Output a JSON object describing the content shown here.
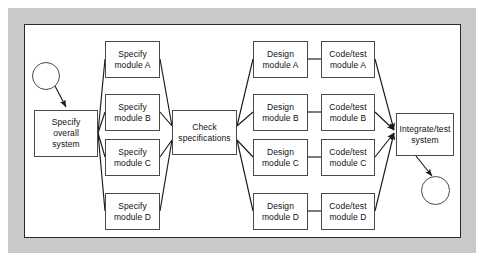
{
  "figure": {
    "background_color": "#ffffff",
    "frame_color": "#c9c9c9",
    "node_fill": "#ffffff",
    "node_border_color": "#4a4a4a",
    "line_color": "#1a1a1a"
  },
  "nodes": {
    "start": {
      "shape": "circle",
      "label": ""
    },
    "end": {
      "shape": "circle",
      "label": ""
    },
    "specify_overall": {
      "line1": "Specify",
      "line2": "overall",
      "line3": "system"
    },
    "check_specs": {
      "line1": "Check",
      "line2": "specifications"
    },
    "integrate": {
      "line1": "Integrate/test",
      "line2": "system"
    },
    "specify_modules": [
      {
        "line1": "Specify",
        "line2": "module A"
      },
      {
        "line1": "Specify",
        "line2": "module B"
      },
      {
        "line1": "Specify",
        "line2": "module C"
      },
      {
        "line1": "Specify",
        "line2": "module D"
      }
    ],
    "design_modules": [
      {
        "line1": "Design",
        "line2": "module A"
      },
      {
        "line1": "Design",
        "line2": "module B"
      },
      {
        "line1": "Design",
        "line2": "module C"
      },
      {
        "line1": "Design",
        "line2": "module D"
      }
    ],
    "code_test_modules": [
      {
        "line1": "Code/test",
        "line2": "module A"
      },
      {
        "line1": "Code/test",
        "line2": "module B"
      },
      {
        "line1": "Code/test",
        "line2": "module C"
      },
      {
        "line1": "Code/test",
        "line2": "module D"
      }
    ]
  },
  "edges": [
    {
      "from": "start",
      "to": "specify_overall",
      "arrow": true
    },
    {
      "from": "specify_overall",
      "to": "specify_module_a",
      "arrow": false
    },
    {
      "from": "specify_overall",
      "to": "specify_module_b",
      "arrow": false
    },
    {
      "from": "specify_overall",
      "to": "specify_module_c",
      "arrow": false
    },
    {
      "from": "specify_overall",
      "to": "specify_module_d",
      "arrow": false
    },
    {
      "from": "specify_module_a",
      "to": "check_specs",
      "arrow": false
    },
    {
      "from": "specify_module_b",
      "to": "check_specs",
      "arrow": false
    },
    {
      "from": "specify_module_c",
      "to": "check_specs",
      "arrow": false
    },
    {
      "from": "specify_module_d",
      "to": "check_specs",
      "arrow": false
    },
    {
      "from": "check_specs",
      "to": "design_module_a",
      "arrow": false
    },
    {
      "from": "check_specs",
      "to": "design_module_b",
      "arrow": false
    },
    {
      "from": "check_specs",
      "to": "design_module_c",
      "arrow": false
    },
    {
      "from": "check_specs",
      "to": "design_module_d",
      "arrow": false
    },
    {
      "from": "design_module_a",
      "to": "code_test_module_a",
      "arrow": false
    },
    {
      "from": "design_module_b",
      "to": "code_test_module_b",
      "arrow": false
    },
    {
      "from": "design_module_c",
      "to": "code_test_module_c",
      "arrow": false
    },
    {
      "from": "design_module_d",
      "to": "code_test_module_d",
      "arrow": false
    },
    {
      "from": "code_test_module_a",
      "to": "integrate",
      "arrow": true
    },
    {
      "from": "code_test_module_b",
      "to": "integrate",
      "arrow": true
    },
    {
      "from": "code_test_module_c",
      "to": "integrate",
      "arrow": true
    },
    {
      "from": "code_test_module_d",
      "to": "integrate",
      "arrow": true
    },
    {
      "from": "integrate",
      "to": "end",
      "arrow": true
    }
  ]
}
